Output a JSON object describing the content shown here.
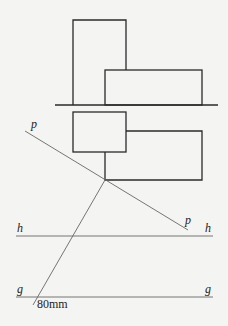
{
  "diagram": {
    "type": "descriptive-geometry projection",
    "labels": {
      "p_top": "p",
      "p_bottom": "p",
      "h_left": "h",
      "h_right": "h",
      "g_left": "g",
      "g_right": "g",
      "dimension": "80mm"
    },
    "colors": {
      "object_stroke": "#2a2a2a",
      "construction_stroke": "#666666",
      "background": "#f4f4f2"
    }
  }
}
